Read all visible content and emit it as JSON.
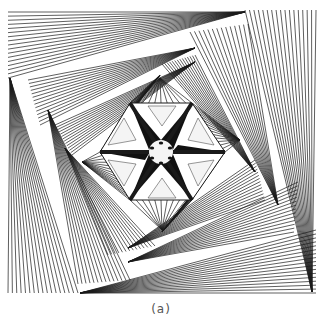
{
  "figure": {
    "caption": "(a)",
    "line_color": "#1a1a1a",
    "background": "#ffffff",
    "fans": [
      {
        "apex": [
          245,
          12
        ],
        "from": [
          8,
          12
        ],
        "to": [
          8,
          75
        ],
        "count": 14
      },
      {
        "apex": [
          8,
          75
        ],
        "from": [
          245,
          12
        ],
        "to": [
          245,
          12
        ],
        "count": 0
      },
      {
        "apex": [
          316,
          290
        ],
        "from": [
          245,
          10
        ],
        "to": [
          316,
          10
        ],
        "count": 14
      },
      {
        "apex": [
          75,
          293
        ],
        "from": [
          316,
          230
        ],
        "to": [
          316,
          293
        ],
        "count": 14
      },
      {
        "apex": [
          8,
          75
        ],
        "from": [
          8,
          293
        ],
        "to": [
          75,
          293
        ],
        "count": 14
      },
      {
        "apex": [
          190,
          48
        ],
        "from": [
          28,
          83
        ],
        "to": [
          40,
          125
        ],
        "count": 12
      },
      {
        "apex": [
          270,
          200
        ],
        "from": [
          190,
          32
        ],
        "to": [
          250,
          25
        ],
        "count": 12
      },
      {
        "apex": [
          135,
          260
        ],
        "from": [
          296,
          185
        ],
        "to": [
          296,
          230
        ],
        "count": 12
      },
      {
        "apex": [
          55,
          110
        ],
        "from": [
          80,
          282
        ],
        "to": [
          130,
          280
        ],
        "count": 12
      },
      {
        "apex": [
          190,
          55
        ],
        "from": [
          55,
          128
        ],
        "to": [
          70,
          153
        ],
        "count": 12
      },
      {
        "apex": [
          250,
          170
        ],
        "from": [
          160,
          65
        ],
        "to": [
          190,
          55
        ],
        "count": 12
      },
      {
        "apex": [
          135,
          248
        ],
        "from": [
          255,
          160
        ],
        "to": [
          265,
          198
        ],
        "count": 12
      },
      {
        "apex": [
          68,
          150
        ],
        "from": [
          110,
          255
        ],
        "to": [
          155,
          245
        ],
        "count": 12
      }
    ],
    "hexagon": [
      [
        100,
        152
      ],
      [
        130,
        103
      ],
      [
        192,
        103
      ],
      [
        225,
        152
      ],
      [
        192,
        200
      ],
      [
        130,
        200
      ]
    ],
    "center": [
      161,
      152
    ]
  }
}
